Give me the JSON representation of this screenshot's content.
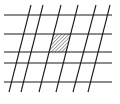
{
  "diagram": {
    "type": "line-grid",
    "colors": {
      "line": "#1a1a1a",
      "background": "#ffffff",
      "hatch": "#333333"
    },
    "horizontal_lines": [
      {
        "y": 15,
        "x1": 4,
        "x2": 112
      },
      {
        "y": 34,
        "x1": 4,
        "x2": 112
      },
      {
        "y": 52,
        "x1": 4,
        "x2": 112
      },
      {
        "y": 63,
        "x1": 4,
        "x2": 112
      },
      {
        "y": 82,
        "x1": 4,
        "x2": 112
      }
    ],
    "slanted_lines": [
      {
        "x_top": 31,
        "y_top": 5,
        "x_bottom": 9,
        "y_bottom": 92
      },
      {
        "x_top": 43,
        "y_top": 5,
        "x_bottom": 21,
        "y_bottom": 92
      },
      {
        "x_top": 61,
        "y_top": 5,
        "x_bottom": 39,
        "y_bottom": 92
      },
      {
        "x_top": 78,
        "y_top": 5,
        "x_bottom": 56,
        "y_bottom": 92
      },
      {
        "x_top": 96,
        "y_top": 5,
        "x_bottom": 73,
        "y_bottom": 92
      },
      {
        "x_top": 110,
        "y_top": 5,
        "x_bottom": 88,
        "y_bottom": 92
      }
    ],
    "shaded_cell": {
      "between_horizontal": [
        1,
        2
      ],
      "between_slanted": [
        2,
        3
      ],
      "fill": "hatched"
    }
  }
}
